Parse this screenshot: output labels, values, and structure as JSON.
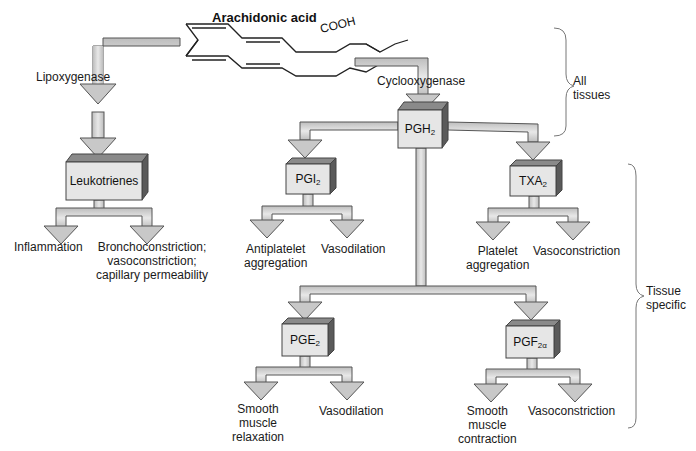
{
  "title": "Arachidonic acid",
  "substrate_group": "COOH",
  "enzymes": {
    "left": "Lipoxygenase",
    "right": "Cyclooxygenase"
  },
  "nodes": {
    "leukotrienes": {
      "label": "Leukotrienes",
      "sub": ""
    },
    "pgh2": {
      "label": "PGH",
      "sub": "2"
    },
    "pgi2": {
      "label": "PGI",
      "sub": "2"
    },
    "txa2": {
      "label": "TXA",
      "sub": "2"
    },
    "pge2": {
      "label": "PGE",
      "sub": "2"
    },
    "pgf2a": {
      "label": "PGF",
      "sub": "2α"
    }
  },
  "effects": {
    "leukotrienes": [
      "Inflammation",
      "Bronchoconstriction;\nvasoconstriction;\ncapillary permeability"
    ],
    "pgi2": [
      "Antiplatelet\naggregation",
      "Vasodilation"
    ],
    "txa2": [
      "Platelet\naggregation",
      "Vasoconstriction"
    ],
    "pge2": [
      "Smooth\nmuscle\nrelaxation",
      "Vasodilation"
    ],
    "pgf2a": [
      "Smooth\nmuscle\ncontraction",
      "Vasoconstriction"
    ]
  },
  "brackets": {
    "top": "All\ntissues",
    "bottom": "Tissue\nspecific"
  },
  "colors": {
    "arrow_fill": "#d4d4d4",
    "arrow_stroke": "#555555",
    "box_front": "#e6e6e6",
    "box_top": "#8a8a8a",
    "box_side": "#5a5a5a",
    "text": "#1a1a1a"
  }
}
